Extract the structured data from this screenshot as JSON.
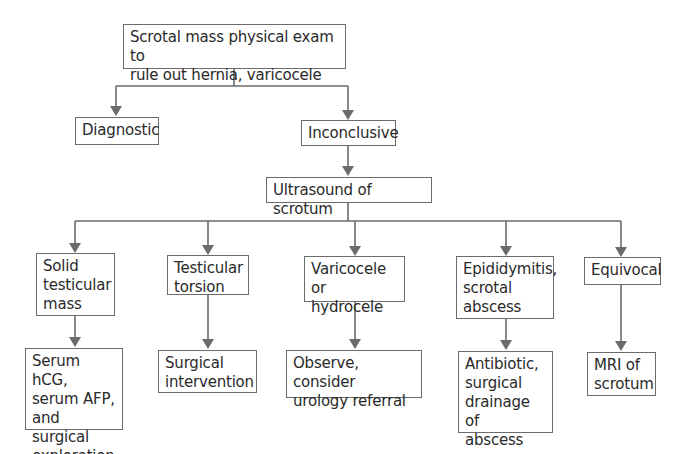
{
  "diagram": {
    "type": "flowchart",
    "root": {
      "label": "Scrotal mass physical exam to\nrule out hernia, varicocele"
    },
    "level1": [
      {
        "label": "Diagnostic"
      },
      {
        "label": "Inconclusive"
      }
    ],
    "imaging": {
      "label": "Ultrasound of scrotum"
    },
    "findings": [
      {
        "label": "Solid\ntesticular\nmass",
        "action": "Serum hCG,\nserum AFP,\nand surgical\nexploration"
      },
      {
        "label": "Testicular\ntorsion",
        "action": "Surgical\nintervention"
      },
      {
        "label": "Varicocele or\nhydrocele",
        "action": "Observe, consider\nurology referral"
      },
      {
        "label": "Epididymitis,\nscrotal\nabscess",
        "action": "Antibiotic,\nsurgical\ndrainage of\nabscess"
      },
      {
        "label": "Equivocal",
        "action": "MRI of\nscrotum"
      }
    ],
    "colors": {
      "line": "#6b6b6b",
      "text": "#2a2a2a",
      "background": "#ffffff"
    }
  }
}
